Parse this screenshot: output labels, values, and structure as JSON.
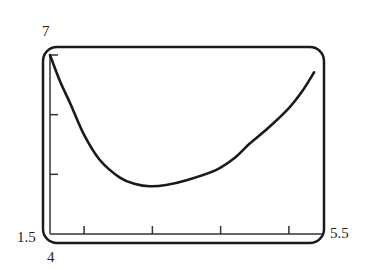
{
  "chart_data": {
    "type": "line",
    "title": "",
    "xlabel": "",
    "ylabel": "",
    "xlim": [
      1.5,
      5.5
    ],
    "ylim": [
      4,
      7
    ],
    "x_ticks": [
      2,
      3,
      4,
      5
    ],
    "y_ticks": [
      5,
      6
    ],
    "tick_labels": {
      "x_min": "1.5",
      "x_max": "5.5",
      "y_min": "4",
      "y_max": "7"
    },
    "grid": false,
    "legend": null,
    "frame": "rounded-rectangle (graphing calculator window)",
    "series": [
      {
        "name": "curve",
        "color": "#1a1a1a",
        "x": [
          1.5,
          1.65,
          1.8,
          2.0,
          2.23,
          2.53,
          2.75,
          2.96,
          3.2,
          3.5,
          3.93,
          4.2,
          4.43,
          4.7,
          5.0,
          5.2,
          5.37
        ],
        "y": [
          7.0,
          6.55,
          6.18,
          5.66,
          5.24,
          4.94,
          4.84,
          4.8,
          4.82,
          4.9,
          5.07,
          5.27,
          5.52,
          5.78,
          6.11,
          6.4,
          6.71
        ]
      }
    ]
  }
}
